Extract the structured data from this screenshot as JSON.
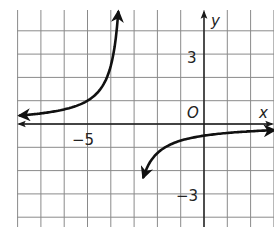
{
  "chart_data": {
    "type": "line",
    "title": "",
    "xlabel": "x",
    "ylabel": "y",
    "origin_label": "O",
    "tick_labels": {
      "x": [
        {
          "value": -5,
          "label": "−5"
        }
      ],
      "y": [
        {
          "value": 3,
          "label": "3"
        },
        {
          "value": -3,
          "label": "−3"
        }
      ]
    },
    "xlim": [
      -8.0,
      3.0
    ],
    "ylim": [
      -4.4,
      4.9
    ],
    "grid": true,
    "grid_step": 1,
    "legend": null,
    "series": [
      {
        "name": "rational function (hyperbola)",
        "approx_formula": "y = -5/3 / (x + 10/3)",
        "vertical_asymptote": -3.33,
        "horizontal_asymptote": 0,
        "branches": [
          {
            "name": "left branch",
            "x": [
              -7.9,
              -7,
              -6,
              -5,
              -4.5,
              -4,
              -3.8,
              -3.6
            ],
            "y": [
              0.36,
              0.45,
              0.63,
              1.0,
              1.43,
              2.5,
              3.6,
              4.9
            ],
            "arrows": "both ends"
          },
          {
            "name": "right branch",
            "x": [
              -2.5,
              -2,
              -1.5,
              -1,
              0,
              1,
              2,
              3
            ],
            "y": [
              -2.0,
              -1.25,
              -0.91,
              -0.72,
              -0.5,
              -0.38,
              -0.31,
              -0.26
            ],
            "arrows": "both ends"
          }
        ]
      }
    ]
  },
  "colors": {
    "grid": "#8a8a8a",
    "axis": "#1a1a1a",
    "curve": "#111111"
  }
}
